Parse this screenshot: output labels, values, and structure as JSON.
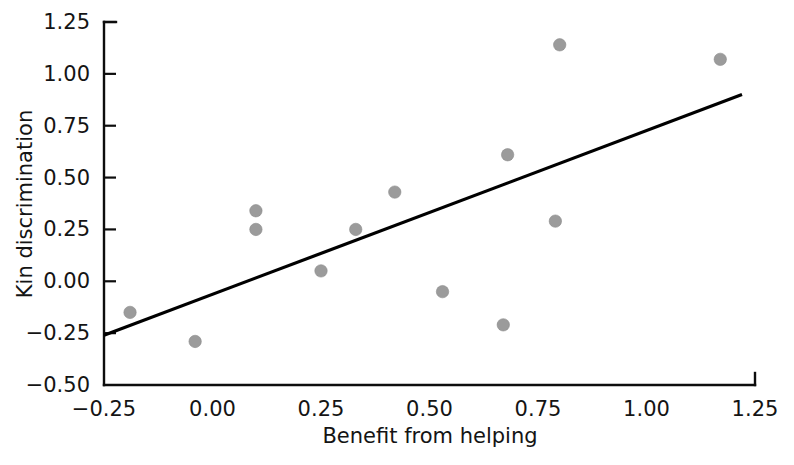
{
  "chart_data": {
    "type": "scatter",
    "title": "",
    "xlabel": "Benefit from helping",
    "ylabel": "Kin discrimination",
    "xlim": [
      -0.25,
      1.25
    ],
    "ylim": [
      -0.5,
      1.25
    ],
    "xticks": [
      "−0.25",
      "0.00",
      "0.25",
      "0.50",
      "0.75",
      "1.00",
      "1.25"
    ],
    "xtick_values": [
      -0.25,
      0.0,
      0.25,
      0.5,
      0.75,
      1.0,
      1.25
    ],
    "yticks": [
      "−0.50",
      "−0.25",
      "0.00",
      "0.25",
      "0.50",
      "0.75",
      "1.00",
      "1.25"
    ],
    "ytick_values": [
      -0.5,
      -0.25,
      0.0,
      0.25,
      0.5,
      0.75,
      1.0,
      1.25
    ],
    "grid": false,
    "legend": false,
    "marker_color": "#9b9b9b",
    "line_color": "#000000",
    "axis_color": "#0d0d0d",
    "points": [
      {
        "x": -0.19,
        "y": -0.15
      },
      {
        "x": -0.04,
        "y": -0.29
      },
      {
        "x": 0.1,
        "y": 0.34
      },
      {
        "x": 0.1,
        "y": 0.25
      },
      {
        "x": 0.25,
        "y": 0.05
      },
      {
        "x": 0.33,
        "y": 0.25
      },
      {
        "x": 0.42,
        "y": 0.43
      },
      {
        "x": 0.53,
        "y": -0.05
      },
      {
        "x": 0.67,
        "y": -0.21
      },
      {
        "x": 0.68,
        "y": 0.61
      },
      {
        "x": 0.79,
        "y": 0.29
      },
      {
        "x": 0.8,
        "y": 1.14
      },
      {
        "x": 1.17,
        "y": 1.07
      }
    ],
    "fit_line": {
      "x_start": -0.25,
      "y_start": -0.26,
      "x_end": 1.22,
      "y_end": 0.9
    }
  }
}
